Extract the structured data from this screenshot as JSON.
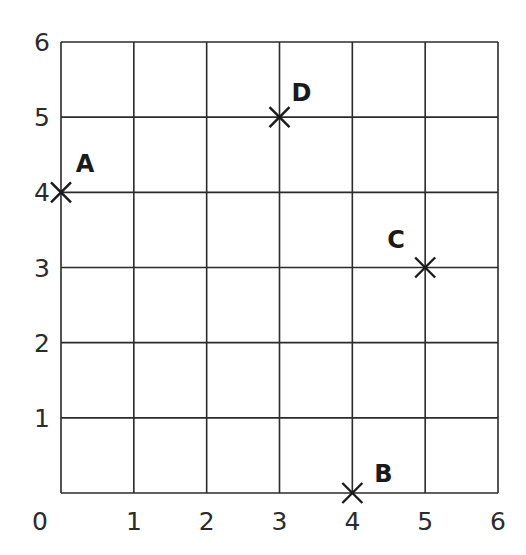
{
  "chart_data": {
    "type": "scatter",
    "title": "",
    "xlabel": "",
    "ylabel": "",
    "xlim": [
      0,
      6
    ],
    "ylim": [
      0,
      6
    ],
    "grid": true,
    "x_ticks": [
      "0",
      "1",
      "2",
      "3",
      "4",
      "5",
      "6"
    ],
    "y_ticks": [
      "0",
      "1",
      "2",
      "3",
      "4",
      "5",
      "6"
    ],
    "marker": "cross",
    "points": [
      {
        "label": "A",
        "x": 0,
        "y": 4
      },
      {
        "label": "B",
        "x": 4,
        "y": 0
      },
      {
        "label": "C",
        "x": 5,
        "y": 3
      },
      {
        "label": "D",
        "x": 3,
        "y": 5
      }
    ]
  }
}
